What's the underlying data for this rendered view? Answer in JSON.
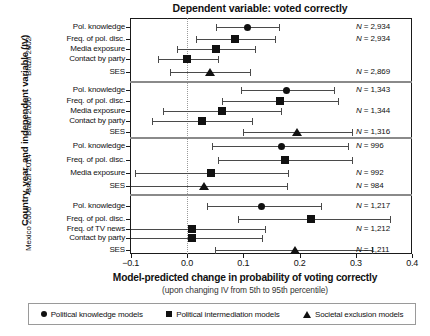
{
  "chart_data": {
    "type": "scatter",
    "title": "Dependent variable: voted correctly",
    "xlabel": "Model-predicted change in probability of voting correctly",
    "xsublabel": "(upon changing IV from 5th to 95th percentile)",
    "ylabel": "Country, year, and independent variable (IV)",
    "xlim": [
      -0.13,
      0.4
    ],
    "xticks": [
      -0.1,
      0.0,
      0.1,
      0.2,
      0.3,
      0.4
    ],
    "xticklabels": [
      "−0.1",
      "0.0",
      "0.1",
      "0.2",
      "0.3",
      "0.4"
    ],
    "grid": false,
    "zero_reference_line": 0.0,
    "legend_position": "bottom",
    "legend": [
      {
        "marker": "circle",
        "label": "Political knowledge models"
      },
      {
        "marker": "square",
        "label": "Political intermediation models"
      },
      {
        "marker": "triangle",
        "label": "Societal exclusion models"
      }
    ],
    "panels": [
      {
        "group": "Brazil 2002",
        "rows": [
          {
            "label": "Pol. knowledge",
            "marker": "circle",
            "estimate": 0.107,
            "ci_low": 0.052,
            "ci_high": 0.164,
            "n": "N = 2,934"
          },
          {
            "label": "Freq. of pol. disc.",
            "marker": "square",
            "estimate": 0.085,
            "ci_low": 0.016,
            "ci_high": 0.156,
            "n": "N = 2,934"
          },
          {
            "label": "Media exposure",
            "marker": "square",
            "estimate": 0.052,
            "ci_low": -0.018,
            "ci_high": 0.121,
            "n": ""
          },
          {
            "label": "Contact by party",
            "marker": "square",
            "estimate": 0.0,
            "ci_low": -0.052,
            "ci_high": 0.055,
            "n": ""
          },
          {
            "label": "SES",
            "marker": "triangle",
            "estimate": 0.041,
            "ci_low": -0.03,
            "ci_high": 0.112,
            "n": "N = 2,869"
          }
        ]
      },
      {
        "group": "Brazil 2006",
        "rows": [
          {
            "label": "Pol. knowledge",
            "marker": "circle",
            "estimate": 0.177,
            "ci_low": 0.096,
            "ci_high": 0.261,
            "n": "N = 1,343"
          },
          {
            "label": "Freq. of pol. disc.",
            "marker": "square",
            "estimate": 0.165,
            "ci_low": 0.062,
            "ci_high": 0.268,
            "n": ""
          },
          {
            "label": "Media exposure",
            "marker": "square",
            "estimate": 0.062,
            "ci_low": -0.043,
            "ci_high": 0.167,
            "n": "N = 1,344"
          },
          {
            "label": "Contact by party",
            "marker": "square",
            "estimate": 0.027,
            "ci_low": -0.062,
            "ci_high": 0.115,
            "n": ""
          },
          {
            "label": "SES",
            "marker": "triangle",
            "estimate": 0.195,
            "ci_low": 0.1,
            "ci_high": 0.293,
            "n": "N = 1,316"
          }
        ]
      },
      {
        "group": "Brazil 2014",
        "rows": [
          {
            "label": "Pol. knowledge",
            "marker": "circle",
            "estimate": 0.167,
            "ci_low": 0.044,
            "ci_high": 0.286,
            "n": "N = 996"
          },
          {
            "label": "Freq. of pol. disc.",
            "marker": "square",
            "estimate": 0.174,
            "ci_low": 0.055,
            "ci_high": 0.293,
            "n": ""
          },
          {
            "label": "Media exposure",
            "marker": "square",
            "estimate": 0.043,
            "ci_low": -0.092,
            "ci_high": 0.179,
            "n": "N = 992"
          },
          {
            "label": "SES",
            "marker": "triangle",
            "estimate": 0.03,
            "ci_low": -0.11,
            "ci_high": 0.178,
            "n": "N = 984"
          }
        ]
      },
      {
        "group": "Mexico 2006",
        "rows": [
          {
            "label": "Pol. knowledge",
            "marker": "circle",
            "estimate": 0.133,
            "ci_low": 0.036,
            "ci_high": 0.238,
            "n": "N = 1,217"
          },
          {
            "label": "Freq. of pol. disc.",
            "marker": "square",
            "estimate": 0.22,
            "ci_low": 0.091,
            "ci_high": 0.36,
            "n": ""
          },
          {
            "label": "Freq. of TV news",
            "marker": "square",
            "estimate": 0.009,
            "ci_low": -0.106,
            "ci_high": 0.139,
            "n": "N = 1,212"
          },
          {
            "label": "Contact by party",
            "marker": "square",
            "estimate": 0.009,
            "ci_low": -0.11,
            "ci_high": 0.133,
            "n": ""
          },
          {
            "label": "SES",
            "marker": "triangle",
            "estimate": 0.192,
            "ci_low": 0.05,
            "ci_high": 0.329,
            "n": "N = 1,211"
          }
        ]
      }
    ]
  }
}
